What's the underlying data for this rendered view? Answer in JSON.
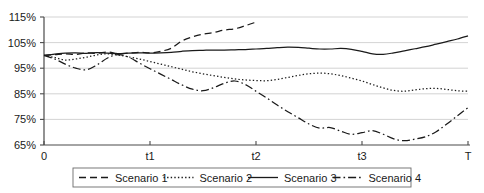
{
  "chart_data": {
    "type": "line",
    "title": "",
    "xlabel": "",
    "ylabel": "",
    "grid": true,
    "legend_position": "bottom",
    "ylim": [
      65,
      115
    ],
    "yticks": [
      65,
      75,
      85,
      95,
      105,
      115
    ],
    "ytick_labels": [
      "65%",
      "75%",
      "85%",
      "95%",
      "105%",
      "115%"
    ],
    "xticks": [
      0,
      1,
      2,
      3,
      4
    ],
    "xtick_labels": [
      "0",
      "t1",
      "t2",
      "t3",
      "T"
    ],
    "x": [
      0.0,
      0.1,
      0.2,
      0.3,
      0.4,
      0.5,
      0.6,
      0.7,
      0.8,
      0.9,
      1.0,
      1.1,
      1.2,
      1.3,
      1.4,
      1.5,
      1.6,
      1.7,
      1.8,
      1.9,
      2.0,
      2.1,
      2.2,
      2.3,
      2.4,
      2.5,
      2.6,
      2.7,
      2.8,
      2.9,
      3.0,
      3.1,
      3.2,
      3.3,
      3.4,
      3.5,
      3.6,
      3.7,
      3.8,
      3.9,
      4.0
    ],
    "series": [
      {
        "name": "Scenario 1",
        "style": "dashed",
        "color": "#1a1a1a",
        "x": [
          0.0,
          0.1,
          0.2,
          0.3,
          0.4,
          0.5,
          0.6,
          0.7,
          0.8,
          0.9,
          1.0,
          1.1,
          1.2,
          1.3,
          1.4,
          1.5,
          1.6,
          1.7,
          1.8,
          1.9,
          2.0
        ],
        "values": [
          100.0,
          100.3,
          100.6,
          100.4,
          101.0,
          100.8,
          101.3,
          100.7,
          100.9,
          101.2,
          101.0,
          101.6,
          102.8,
          105.6,
          107.2,
          108.3,
          108.9,
          109.9,
          110.4,
          111.6,
          113.0
        ]
      },
      {
        "name": "Scenario 2",
        "style": "dotted",
        "color": "#1a1a1a",
        "x": [
          0.0,
          0.1,
          0.2,
          0.3,
          0.4,
          0.5,
          0.6,
          0.7,
          0.8,
          0.9,
          1.0,
          1.1,
          1.2,
          1.3,
          1.4,
          1.5,
          1.6,
          1.7,
          1.8,
          1.9,
          2.0,
          2.1,
          2.2,
          2.3,
          2.4,
          2.5,
          2.6,
          2.7,
          2.8,
          2.9,
          3.0,
          3.1,
          3.2,
          3.3,
          3.4,
          3.5,
          3.6,
          3.7,
          3.8,
          3.9,
          4.0
        ],
        "values": [
          100.0,
          99.2,
          98.2,
          98.6,
          99.3,
          100.2,
          100.6,
          100.1,
          99.4,
          98.6,
          97.6,
          96.6,
          95.6,
          94.6,
          93.6,
          92.8,
          92.1,
          91.4,
          90.8,
          90.4,
          90.2,
          90.1,
          90.6,
          91.4,
          92.2,
          92.8,
          93.1,
          92.8,
          92.1,
          91.1,
          90.0,
          88.6,
          87.3,
          86.3,
          86.0,
          86.5,
          87.0,
          87.1,
          86.7,
          86.2,
          86.0
        ]
      },
      {
        "name": "Scenario 3",
        "style": "solid",
        "color": "#1a1a1a",
        "x": [
          0.0,
          0.1,
          0.2,
          0.3,
          0.4,
          0.5,
          0.6,
          0.7,
          0.8,
          0.9,
          1.0,
          1.1,
          1.2,
          1.3,
          1.4,
          1.5,
          1.6,
          1.7,
          1.8,
          1.9,
          2.0,
          2.1,
          2.2,
          2.3,
          2.4,
          2.5,
          2.6,
          2.7,
          2.8,
          2.9,
          3.0,
          3.1,
          3.2,
          3.3,
          3.4,
          3.5,
          3.6,
          3.7,
          3.8,
          3.9,
          4.0
        ],
        "values": [
          100.0,
          100.5,
          100.9,
          101.0,
          100.8,
          101.1,
          100.9,
          100.7,
          100.9,
          101.0,
          100.9,
          101.0,
          101.2,
          101.6,
          101.9,
          102.0,
          102.1,
          102.1,
          102.2,
          102.3,
          102.5,
          102.7,
          103.0,
          103.2,
          103.1,
          102.8,
          102.5,
          102.5,
          102.7,
          102.4,
          101.6,
          100.6,
          100.4,
          101.0,
          101.8,
          102.6,
          103.4,
          104.4,
          105.4,
          106.4,
          107.6
        ]
      },
      {
        "name": "Scenario 4",
        "style": "dash-dot",
        "color": "#1a1a1a",
        "x": [
          0.0,
          0.1,
          0.2,
          0.3,
          0.4,
          0.5,
          0.6,
          0.7,
          0.8,
          0.9,
          1.0,
          1.1,
          1.2,
          1.3,
          1.4,
          1.5,
          1.6,
          1.7,
          1.8,
          1.9,
          2.0,
          2.1,
          2.2,
          2.3,
          2.4,
          2.5,
          2.6,
          2.7,
          2.8,
          2.9,
          3.0,
          3.1,
          3.2,
          3.3,
          3.4,
          3.5,
          3.6,
          3.7,
          3.8,
          3.9,
          4.0
        ],
        "values": [
          100.0,
          98.6,
          96.6,
          95.0,
          94.4,
          96.3,
          99.0,
          100.3,
          99.3,
          97.0,
          94.8,
          92.7,
          90.6,
          88.5,
          86.8,
          86.2,
          87.4,
          89.1,
          90.0,
          88.6,
          86.0,
          83.4,
          80.6,
          78.0,
          75.6,
          73.2,
          71.6,
          71.8,
          70.4,
          69.2,
          69.8,
          70.6,
          69.2,
          67.4,
          66.7,
          67.3,
          68.2,
          70.2,
          73.2,
          76.4,
          79.6
        ]
      }
    ],
    "legend": [
      {
        "label": "Scenario 1",
        "style": "dashed"
      },
      {
        "label": "Scenario 2",
        "style": "dotted"
      },
      {
        "label": "Scenario 3",
        "style": "solid"
      },
      {
        "label": "Scenario 4",
        "style": "dash-dot"
      }
    ]
  }
}
